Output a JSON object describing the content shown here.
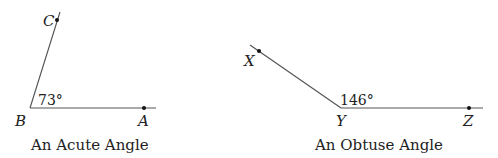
{
  "diagram": {
    "acute": {
      "caption": "An Acute Angle",
      "angle_label": "73°",
      "points": {
        "vertex": "B",
        "ray1": "A",
        "ray2": "C"
      },
      "measure_degrees": 73
    },
    "obtuse": {
      "caption": "An Obtuse Angle",
      "angle_label": "146°",
      "points": {
        "vertex": "Y",
        "ray1": "Z",
        "ray2": "X"
      },
      "measure_degrees": 146
    },
    "colors": {
      "line": "#555555",
      "text": "#222222",
      "point": "#111111"
    }
  }
}
